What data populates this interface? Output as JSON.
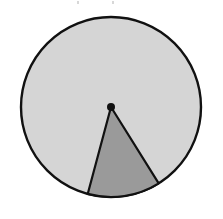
{
  "figure": {
    "background_color": "#ffffff",
    "canvas": {
      "width": 223,
      "height": 219
    }
  },
  "chart_data": {
    "type": "pie",
    "title": "",
    "subtitle": "",
    "xlabel": "",
    "ylabel": "",
    "grid": false,
    "legend_position": "none",
    "center": {
      "x": 111,
      "y": 107
    },
    "radius": 91,
    "start_angle_deg": 58,
    "categories": [
      "Remaining circle",
      "Shaded sector"
    ],
    "values": [
      313,
      47
    ],
    "units": "degrees",
    "percentages": [
      86.9,
      13.1
    ],
    "slices": [
      {
        "label": "Remaining circle",
        "angle_deg": 313,
        "percent": 86.9,
        "fill": "#d5d5d5",
        "stroke": "#111111"
      },
      {
        "label": "Shaded sector",
        "angle_deg": 47,
        "percent": 13.1,
        "fill": "#9a9a9a",
        "stroke": "#111111",
        "sector_edge_left_deg": 105,
        "sector_edge_right_deg": 58
      }
    ],
    "annotations": [
      {
        "name": "center-point",
        "x": 111,
        "y": 107,
        "radius": 4,
        "color": "#111111"
      }
    ]
  },
  "colors": {
    "circle_fill": "#d5d5d5",
    "sector_fill": "#9a9a9a",
    "outline": "#111111",
    "center_dot": "#111111",
    "background": "#ffffff"
  }
}
